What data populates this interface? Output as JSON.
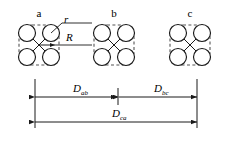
{
  "figure": {
    "name": "three-phase-conductor-bundle-spacing-diagram",
    "background": "#ffffff",
    "stroke_color": "#1a1a1a",
    "dashed_color": "#555555"
  },
  "clusters": [
    {
      "id": "a",
      "label": "a",
      "center_x": 39,
      "center_y": 45,
      "sub_conductors": 4,
      "sub_radius": 8.5,
      "offset": 12,
      "bundle_radius": 20
    },
    {
      "id": "b",
      "label": "b",
      "center_x": 114,
      "center_y": 45,
      "sub_conductors": 4,
      "sub_radius": 8.5,
      "offset": 12,
      "bundle_radius": 20
    },
    {
      "id": "c",
      "label": "c",
      "center_x": 190,
      "center_y": 45,
      "sub_conductors": 4,
      "sub_radius": 8.5,
      "offset": 12,
      "bundle_radius": 20
    }
  ],
  "annotations": {
    "sub_conductor_radius": {
      "symbol": "r",
      "label_x": 64,
      "label_y": 19,
      "target_x": 51,
      "target_y": 33
    },
    "bundle_radius": {
      "symbol": "R",
      "label_x": 66,
      "label_y": 37,
      "from_x": 39,
      "from_y": 45,
      "to_x": 55,
      "to_y": 45
    }
  },
  "dimensions": {
    "upper": [
      {
        "name": "D_ab",
        "symbol": "D",
        "subscript": "ab",
        "x1": 35,
        "x2": 117,
        "y": 97,
        "label_x": 73,
        "label_y": 88
      },
      {
        "name": "D_bc",
        "symbol": "D",
        "subscript": "bc",
        "x1": 119,
        "x2": 197,
        "y": 97,
        "label_x": 154,
        "label_y": 88
      }
    ],
    "lower": [
      {
        "name": "D_ca",
        "symbol": "D",
        "subscript": "ca",
        "x1": 35,
        "x2": 197,
        "y": 122,
        "label_x": 112,
        "label_y": 113
      }
    ],
    "extension_lines": [
      {
        "name": "extension-line-left",
        "x": 35,
        "y1": 79,
        "y2": 128
      },
      {
        "name": "extension-line-middle",
        "x": 118,
        "y1": 88,
        "y2": 105
      },
      {
        "name": "extension-line-right",
        "x": 197,
        "y1": 79,
        "y2": 128
      }
    ]
  }
}
